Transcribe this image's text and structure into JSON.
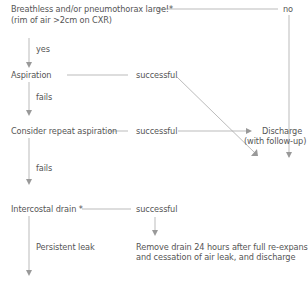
{
  "diagram": {
    "nodes": {
      "start_line1": "Breathless and/or pneumothorax large!*",
      "start_line2": "(rim of air >2cm on CXR)",
      "aspiration": "Aspiration",
      "repeat": "Consider repeat aspiration",
      "drain": "Intercostal drain *",
      "discharge_line1": "Discharge",
      "discharge_line2": "(with follow-up)",
      "remove_line1": "Remove drain 24 hours after full re-expansion",
      "remove_line2": "and cessation of air leak, and discharge"
    },
    "edge_labels": {
      "no": "no",
      "yes": "yes",
      "fails1": "fails",
      "fails2": "fails",
      "successful1": "successful",
      "successful2": "successful",
      "successful3": "successful",
      "persistent": "Persistent leak"
    },
    "colors": {
      "text": "#555555",
      "line": "#aaaaaa",
      "arrow": "#999999"
    }
  }
}
